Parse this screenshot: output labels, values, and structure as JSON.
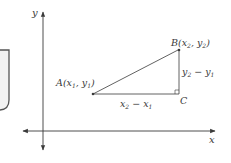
{
  "diagram": {
    "type": "coordinate-distance-diagram",
    "axes": {
      "x_label": "x",
      "y_label": "y"
    },
    "points": {
      "A": {
        "name": "A",
        "label_x": "x",
        "label_x_sub": "1",
        "label_y": "y",
        "label_y_sub": "1"
      },
      "B": {
        "name": "B",
        "label_x": "x",
        "label_x_sub": "2",
        "label_y": "y",
        "label_y_sub": "2"
      },
      "C": {
        "name": "C"
      }
    },
    "segments": {
      "horizontal": {
        "a": "x",
        "a_sub": "2",
        "op": "−",
        "b": "x",
        "b_sub": "1"
      },
      "vertical": {
        "a": "y",
        "a_sub": "2",
        "op": "−",
        "b": "y",
        "b_sub": "1"
      }
    },
    "colors": {
      "line": "#3a3a3a",
      "text": "#3a3a3a",
      "side_panel_border": "#555555",
      "side_panel_fill": "#f2f2f2"
    }
  }
}
